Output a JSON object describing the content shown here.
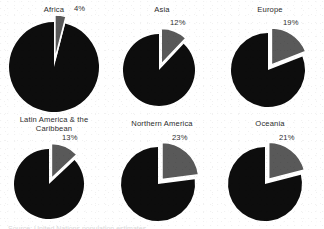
{
  "figure": {
    "background_color": "#ffffff",
    "slice_fill": "#595959",
    "remainder_fill": "#0d0d0d",
    "gap_color": "#ffffff",
    "caption_remnant": "Source: United Nations population estimates"
  },
  "chart_data": {
    "type": "pie",
    "title": "",
    "subtitle": "",
    "xlabel": "",
    "ylabel": "",
    "legend": [],
    "grid": false,
    "layout": {
      "rows": 2,
      "cols": 3
    },
    "panels": [
      {
        "label": "Africa",
        "label_lines": [
          "Africa"
        ],
        "value": 4,
        "value_text": "4%",
        "remainder": 96,
        "slice_color": "#595959",
        "remainder_color": "#0d0d0d"
      },
      {
        "label": "Asia",
        "label_lines": [
          "Asia"
        ],
        "value": 12,
        "value_text": "12%",
        "remainder": 88,
        "slice_color": "#595959",
        "remainder_color": "#0d0d0d"
      },
      {
        "label": "Europe",
        "label_lines": [
          "Europe"
        ],
        "value": 19,
        "value_text": "19%",
        "remainder": 81,
        "slice_color": "#595959",
        "remainder_color": "#0d0d0d"
      },
      {
        "label": "Latin America & the Caribbean",
        "label_lines": [
          "Latin America & the",
          "Caribbean"
        ],
        "value": 13,
        "value_text": "13%",
        "remainder": 87,
        "slice_color": "#595959",
        "remainder_color": "#0d0d0d"
      },
      {
        "label": "Northern America",
        "label_lines": [
          "Northern America"
        ],
        "value": 23,
        "value_text": "23%",
        "remainder": 77,
        "slice_color": "#595959",
        "remainder_color": "#0d0d0d"
      },
      {
        "label": "Oceania",
        "label_lines": [
          "Oceania"
        ],
        "value": 21,
        "value_text": "21%",
        "remainder": 79,
        "slice_color": "#595959",
        "remainder_color": "#0d0d0d"
      }
    ]
  }
}
